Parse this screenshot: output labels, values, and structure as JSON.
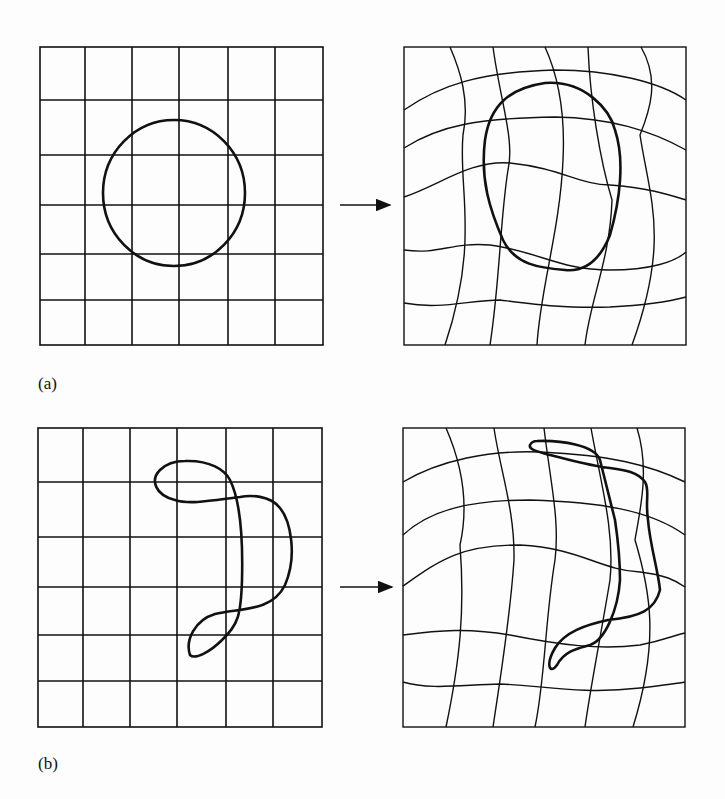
{
  "figure": {
    "panels": [
      {
        "label": "(a)",
        "description": "Regular 6x6 grid with a circle, mapped to a deformed grid with a deformed closed curve",
        "source_grid": {
          "rows": 6,
          "cols": 6,
          "shape": "circle"
        },
        "target_grid": {
          "rows": 6,
          "cols": 6,
          "deformed": true,
          "shape": "deformed-oval"
        }
      },
      {
        "label": "(b)",
        "description": "Regular 6x6 grid with an irregular closed curve, mapped to a deformed grid with the deformed curve",
        "source_grid": {
          "rows": 6,
          "cols": 6,
          "shape": "irregular-loop"
        },
        "target_grid": {
          "rows": 6,
          "cols": 6,
          "deformed": true,
          "shape": "deformed-irregular-loop"
        }
      }
    ],
    "arrow_glyph": "right-arrow",
    "colors": {
      "line": "#111111",
      "background": "#fdfdfd"
    }
  }
}
